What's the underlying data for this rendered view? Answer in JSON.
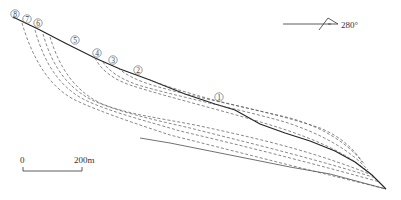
{
  "diagram": {
    "type": "slope cross-section with potential sliding surfaces",
    "orientation": {
      "label": "280°",
      "icon": "direction-arrow-icon"
    },
    "scale_bar": {
      "start_label": "0",
      "end_label": "200m"
    },
    "sliding_surfaces": [
      {
        "id": "1",
        "label": "①"
      },
      {
        "id": "2",
        "label": "②"
      },
      {
        "id": "3",
        "label": "③"
      },
      {
        "id": "4",
        "label": "④"
      },
      {
        "id": "5",
        "label": "⑤"
      },
      {
        "id": "6",
        "label": "⑥"
      },
      {
        "id": "7",
        "label": "⑦"
      },
      {
        "id": "8",
        "label": "⑧"
      }
    ],
    "colors": {
      "line": "#222222",
      "dashed": "#555555",
      "background": "#ffffff"
    }
  }
}
